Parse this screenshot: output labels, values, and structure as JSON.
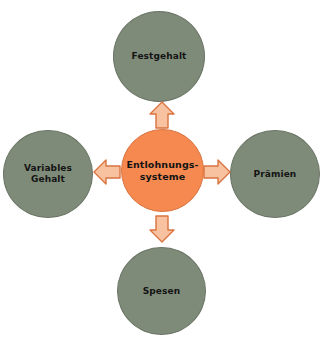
{
  "diagram": {
    "type": "hub-and-spoke",
    "colors": {
      "center_fill": "#f5894f",
      "center_stroke": "#d9733f",
      "satellite_fill": "#7f8b79",
      "satellite_stroke": "#6b7566",
      "arrow_fill": "#f8c2a0",
      "arrow_stroke": "#d9733f",
      "text": "#141414",
      "background": "#ffffff"
    },
    "center": {
      "label": "Entlohnungs-\nsysteme"
    },
    "nodes": [
      {
        "id": "festgehalt",
        "label": "Festgehalt",
        "position": "top"
      },
      {
        "id": "praemien",
        "label": "Prämien",
        "position": "right"
      },
      {
        "id": "spesen",
        "label": "Spesen",
        "position": "bottom"
      },
      {
        "id": "variables-gehalt",
        "label": "Variables\nGehalt",
        "position": "left"
      }
    ],
    "arrows": [
      {
        "id": "arrow-up",
        "direction": "up",
        "from": "center",
        "to": "festgehalt"
      },
      {
        "id": "arrow-right",
        "direction": "right",
        "from": "center",
        "to": "praemien"
      },
      {
        "id": "arrow-down",
        "direction": "down",
        "from": "center",
        "to": "spesen"
      },
      {
        "id": "arrow-left",
        "direction": "left",
        "from": "center",
        "to": "variables-gehalt"
      }
    ]
  }
}
